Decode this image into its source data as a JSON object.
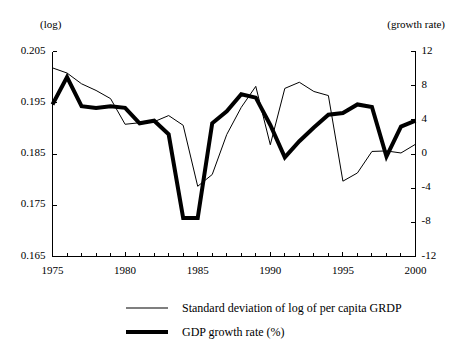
{
  "chart_data": {
    "type": "line",
    "title": "",
    "subtitle": "",
    "left_axis_unit": "(log)",
    "right_axis_unit": "(growth rate)",
    "xlabel": "",
    "ylabel_left": "",
    "ylabel_right": "",
    "grid": false,
    "legend_position": "below",
    "xlim": [
      1975,
      2000
    ],
    "xticks": [
      1975,
      1980,
      1985,
      1990,
      1995,
      2000
    ],
    "xtick_labels": [
      "1975",
      "1980",
      "1985",
      "1990",
      "1995",
      "2000"
    ],
    "xticks_minor_every": 1,
    "ylim_left": [
      0.165,
      0.205
    ],
    "yticks_left": [
      0.165,
      0.175,
      0.185,
      0.195,
      0.205
    ],
    "ytick_labels_left": [
      "0.165",
      "0.175",
      "0.185",
      "0.195",
      "0.205"
    ],
    "ylim_right": [
      -12,
      12
    ],
    "yticks_right": [
      -12,
      -8,
      -4,
      0,
      4,
      8,
      12
    ],
    "ytick_labels_right": [
      "-12",
      "-8",
      "-4",
      "0",
      "4",
      "8",
      "12"
    ],
    "x": [
      1975,
      1976,
      1977,
      1978,
      1979,
      1980,
      1981,
      1982,
      1983,
      1984,
      1985,
      1986,
      1987,
      1988,
      1989,
      1990,
      1991,
      1992,
      1993,
      1994,
      1995,
      1996,
      1997,
      1998,
      1999,
      2000
    ],
    "series": [
      {
        "name": "Standard deviation of log of per capita GRDP",
        "axis": "left",
        "style": "thin",
        "color": "#000000",
        "width": 1,
        "values": [
          0.2018,
          0.2008,
          0.1987,
          0.1974,
          0.1958,
          0.1908,
          0.1911,
          0.1913,
          0.1925,
          0.1906,
          0.1787,
          0.181,
          0.1888,
          0.1941,
          0.1982,
          0.1868,
          0.1978,
          0.199,
          0.1972,
          0.1964,
          0.1797,
          0.1813,
          0.1855,
          0.1856,
          0.1852,
          0.1869
        ]
      },
      {
        "name": "GDP growth rate (%)",
        "axis": "right",
        "style": "thick",
        "color": "#000000",
        "width": 4,
        "values": [
          5.8,
          9.0,
          5.6,
          5.4,
          5.6,
          5.4,
          3.6,
          3.9,
          2.3,
          -7.5,
          -7.5,
          3.6,
          5.0,
          7.0,
          6.6,
          3.4,
          -0.4,
          1.5,
          3.1,
          4.6,
          4.8,
          5.8,
          5.5,
          -0.3,
          3.2,
          3.9
        ]
      }
    ]
  },
  "legend": {
    "items": [
      {
        "label": "Standard deviation of log of per capita GRDP",
        "style": "thin"
      },
      {
        "label": "GDP growth rate (%)",
        "style": "thick"
      }
    ]
  }
}
